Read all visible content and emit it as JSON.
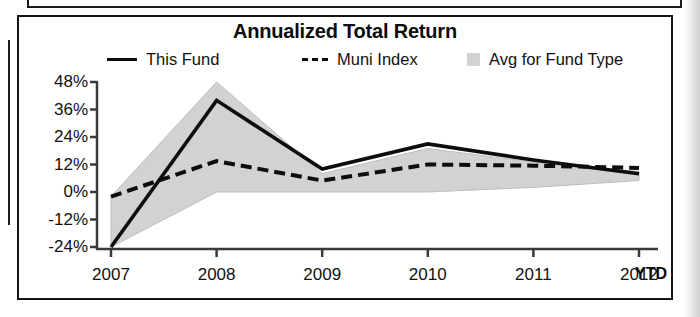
{
  "chart_panel": {
    "title": "Annualized Total Return"
  },
  "legend": {
    "items": [
      {
        "label": "This Fund",
        "marker": "solid-line",
        "color": "#0d0d0d"
      },
      {
        "label": "Muni Index",
        "marker": "dashed-line",
        "color": "#0d0d0d"
      },
      {
        "label": "Avg for Fund Type",
        "marker": "filled-square",
        "color": "#d2d2d2"
      }
    ]
  },
  "axis": {
    "y_ticks": [
      "48%",
      "36%",
      "24%",
      "12%",
      "0%",
      "-12%",
      "-24%"
    ],
    "x_ticks": [
      "2007",
      "2008",
      "2009",
      "2010",
      "2011",
      "2012"
    ],
    "x_suffix": "YTD"
  },
  "chart_data": {
    "type": "line",
    "title": "Annualized Total Return",
    "xlabel": "",
    "ylabel": "",
    "x": [
      "2007",
      "2008",
      "2009",
      "2010",
      "2011",
      "2012"
    ],
    "x_note": "2012 value is YTD",
    "ylim": [
      -24,
      48
    ],
    "y_ticks": [
      -24,
      -12,
      0,
      12,
      24,
      36,
      48
    ],
    "y_tick_labels": [
      "-24%",
      "-12%",
      "0%",
      "12%",
      "24%",
      "36%",
      "48%"
    ],
    "y_unit": "percent",
    "grid": false,
    "legend_position": "top",
    "series": [
      {
        "name": "This Fund",
        "style": "solid",
        "color": "#0d0d0d",
        "values": [
          -24,
          40,
          10,
          21,
          14,
          8
        ]
      },
      {
        "name": "Muni Index",
        "style": "dashed",
        "color": "#0d0d0d",
        "values": [
          -2,
          13.5,
          5,
          12,
          11.5,
          10.5
        ]
      }
    ],
    "band": {
      "name": "Avg for Fund Type",
      "style": "shaded-area",
      "color": "#d2d2d2",
      "upper": [
        -2,
        48,
        8,
        19,
        13,
        9
      ],
      "lower": [
        -24,
        0,
        0,
        0,
        2,
        5
      ]
    }
  }
}
